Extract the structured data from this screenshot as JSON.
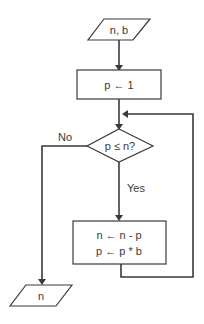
{
  "flowchart": {
    "input": {
      "label": "n, b"
    },
    "init": {
      "label": "p ← 1"
    },
    "decision": {
      "label": "p ≤ n?"
    },
    "branches": {
      "no": "No",
      "yes": "Yes"
    },
    "process": {
      "line1": "n ← n - p",
      "line2": "p ← p * b"
    },
    "output": {
      "label": "n"
    }
  },
  "colors": {
    "stroke": "#3a3a3a",
    "fill": "#ffffff",
    "text": "#3a3a3a"
  }
}
